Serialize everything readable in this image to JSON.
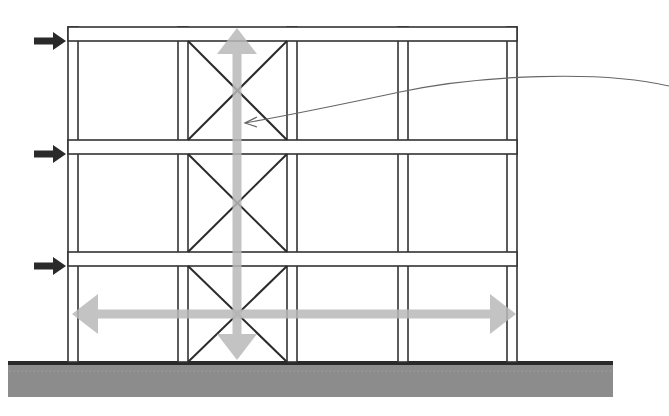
{
  "diagram": {
    "title": "",
    "colors": {
      "line": "#333333",
      "brace": "#2b2b2b",
      "load_arrow": "#2a2a2a",
      "force_arrow": "#b8b8b8",
      "ground_fill": "#8c8c8c",
      "ground_top": "#2a2a2a",
      "leader": "#666666",
      "background": "#ffffff"
    },
    "frame": {
      "left": 68,
      "right": 517,
      "beams": [
        {
          "name": "roof-beam",
          "top": 27,
          "bottom": 41
        },
        {
          "name": "floor-2-beam",
          "top": 140,
          "bottom": 154
        },
        {
          "name": "floor-1-beam",
          "top": 252,
          "bottom": 266
        }
      ],
      "columns": [
        {
          "name": "column-1",
          "x1": 68,
          "x2": 78
        },
        {
          "name": "column-2",
          "x1": 178,
          "x2": 188
        },
        {
          "name": "column-3",
          "x1": 287,
          "x2": 297
        },
        {
          "name": "column-4",
          "x1": 398,
          "x2": 408
        },
        {
          "name": "column-5",
          "x1": 507,
          "x2": 517
        }
      ],
      "braced_bay": {
        "x1": 188,
        "x2": 287
      },
      "base_y": 362
    },
    "lateral_loads": [
      {
        "name": "roof-load-arrow",
        "y": 41
      },
      {
        "name": "floor-2-load-arrow",
        "y": 154
      },
      {
        "name": "floor-1-load-arrow",
        "y": 266
      }
    ],
    "force_arrows": {
      "vertical": {
        "x": 237,
        "y_top": 28,
        "y_bottom": 360,
        "label": "vertical-force"
      },
      "horizontal": {
        "y": 314,
        "x_left": 72,
        "x_right": 516,
        "label": "horizontal-force"
      }
    },
    "ground": {
      "x1": 8,
      "x2": 613,
      "top": 362,
      "bottom": 397
    },
    "leader": {
      "from_x": 669,
      "from_y": 86,
      "to_x": 245,
      "to_y": 123
    }
  }
}
